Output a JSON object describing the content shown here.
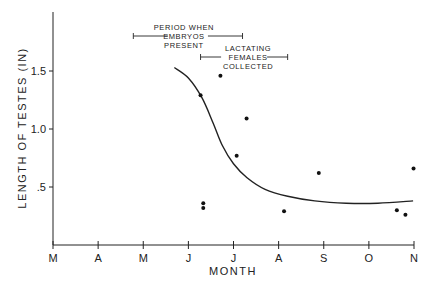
{
  "chart_data": {
    "type": "scatter",
    "title": "",
    "xlabel": "MONTH",
    "ylabel": "LENGTH OF TESTES (IN)",
    "x_ticks": [
      "M",
      "A",
      "M",
      "J",
      "J",
      "A",
      "S",
      "O",
      "N"
    ],
    "x_range_months": [
      0,
      8
    ],
    "y_ticks": [
      {
        "value": 0.5,
        "label": ".5"
      },
      {
        "value": 1.0,
        "label": "1.0"
      },
      {
        "value": 1.5,
        "label": "1.5"
      }
    ],
    "ylim": [
      0,
      2.0
    ],
    "grid": false,
    "legend": "none",
    "points": [
      {
        "x": 3.27,
        "y": 1.29
      },
      {
        "x": 3.33,
        "y": 0.36
      },
      {
        "x": 3.33,
        "y": 0.32
      },
      {
        "x": 3.71,
        "y": 1.46
      },
      {
        "x": 4.07,
        "y": 0.77
      },
      {
        "x": 4.29,
        "y": 1.09
      },
      {
        "x": 5.12,
        "y": 0.29
      },
      {
        "x": 5.89,
        "y": 0.62
      },
      {
        "x": 7.62,
        "y": 0.3
      },
      {
        "x": 7.81,
        "y": 0.26
      },
      {
        "x": 7.99,
        "y": 0.66
      }
    ],
    "fit_curve": [
      {
        "x": 2.69,
        "y": 1.53
      },
      {
        "x": 3.0,
        "y": 1.44
      },
      {
        "x": 3.3,
        "y": 1.27
      },
      {
        "x": 3.55,
        "y": 1.05
      },
      {
        "x": 3.75,
        "y": 0.86
      },
      {
        "x": 4.0,
        "y": 0.7
      },
      {
        "x": 4.3,
        "y": 0.58
      },
      {
        "x": 4.7,
        "y": 0.48
      },
      {
        "x": 5.2,
        "y": 0.42
      },
      {
        "x": 5.8,
        "y": 0.38
      },
      {
        "x": 6.5,
        "y": 0.36
      },
      {
        "x": 7.2,
        "y": 0.36
      },
      {
        "x": 7.98,
        "y": 0.38
      }
    ],
    "annotations": [
      {
        "lines": [
          "PERIOD WHEN",
          "EMBRYOS",
          "PRESENT"
        ],
        "x_start": 1.78,
        "x_end": 4.2
      },
      {
        "lines": [
          "LACTATING",
          "FEMALES",
          "COLLECTED"
        ],
        "x_start": 3.27,
        "x_end": 5.2
      }
    ]
  }
}
